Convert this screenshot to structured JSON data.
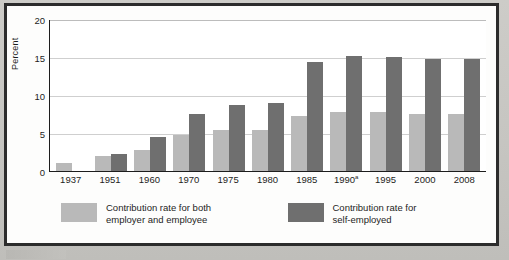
{
  "chart_data": {
    "type": "bar",
    "title": "",
    "xlabel": "",
    "ylabel": "Percent",
    "ylim": [
      0,
      20
    ],
    "yticks": [
      0,
      5,
      10,
      15,
      20
    ],
    "grid": true,
    "legend_position": "bottom",
    "categories": [
      "1937",
      "1951",
      "1960",
      "1970",
      "1975",
      "1980",
      "1985",
      "1990a",
      "1995",
      "2000",
      "2008"
    ],
    "category_labels": [
      {
        "text": "1937",
        "sup": ""
      },
      {
        "text": "1951",
        "sup": ""
      },
      {
        "text": "1960",
        "sup": ""
      },
      {
        "text": "1970",
        "sup": ""
      },
      {
        "text": "1975",
        "sup": ""
      },
      {
        "text": "1980",
        "sup": ""
      },
      {
        "text": "1985",
        "sup": ""
      },
      {
        "text": "1990",
        "sup": "a"
      },
      {
        "text": "1995",
        "sup": ""
      },
      {
        "text": "2000",
        "sup": ""
      },
      {
        "text": "2008",
        "sup": ""
      }
    ],
    "series": [
      {
        "name": "Contribution rate for both employer and employee",
        "color": "#b9b9b9",
        "values": [
          1.0,
          2.0,
          2.75,
          4.8,
          5.35,
          5.4,
          7.3,
          7.8,
          7.75,
          7.5,
          7.5
        ]
      },
      {
        "name": "Contribution rate for self-employed",
        "color": "#6f6f6f",
        "values": [
          null,
          2.25,
          4.5,
          7.5,
          8.7,
          9.0,
          14.3,
          15.1,
          15.0,
          14.7,
          14.75
        ]
      }
    ]
  },
  "legend": {
    "items": [
      {
        "swatch": "light",
        "color": "#b9b9b9",
        "line1": "Contribution rate for both",
        "line2": "employer and employee"
      },
      {
        "swatch": "dark",
        "color": "#6f6f6f",
        "line1": "Contribution rate for",
        "line2": "self-employed"
      }
    ]
  },
  "axis": {
    "y_title": "Percent",
    "y_tick_labels": [
      "20",
      "15",
      "10",
      "5",
      "0"
    ]
  }
}
